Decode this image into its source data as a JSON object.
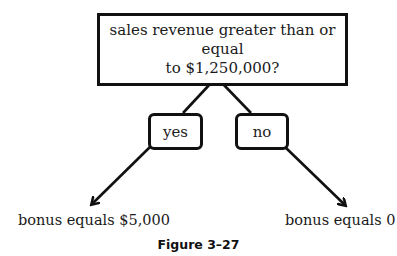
{
  "diagram": {
    "type": "decision-tree",
    "question": {
      "line1": "sales revenue greater than or equal",
      "line2": "to $1,250,000?"
    },
    "branches": [
      {
        "label": "yes",
        "outcome": "bonus equals $5,000"
      },
      {
        "label": "no",
        "outcome": "bonus equals 0"
      }
    ],
    "caption": "Figure 3–27",
    "colors": {
      "stroke": "#111111",
      "background": "#ffffff",
      "text": "#1a1a1a"
    }
  }
}
